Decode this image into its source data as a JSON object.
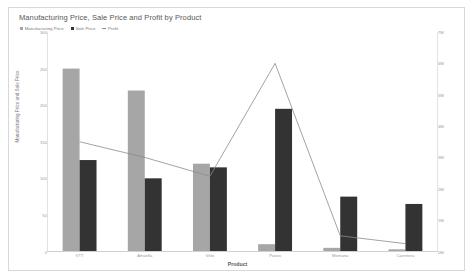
{
  "chart_data": {
    "type": "bar",
    "title": "Manufacturing Price, Sale Price and Profit by Product",
    "xlabel": "Product",
    "ylabel": "Manufacturing Price and Sale Price",
    "y2label": "Profit",
    "categories": [
      "VTT",
      "Amarilla",
      "Velo",
      "Paseo",
      "Montana",
      "Carretera"
    ],
    "series": [
      {
        "name": "Manufacturing Price",
        "type": "bar",
        "axis": "left",
        "color": "#a6a6a6",
        "values": [
          250,
          220,
          120,
          10,
          5,
          3
        ]
      },
      {
        "name": "Sale Price",
        "type": "bar",
        "axis": "left",
        "color": "#333333",
        "values": [
          125,
          100,
          115,
          195,
          75,
          65
        ]
      },
      {
        "name": "Profit",
        "type": "line",
        "axis": "right",
        "color": "#8c8c8c",
        "values": [
          3500000,
          3000000,
          2400000,
          6000000,
          500000,
          250000
        ]
      }
    ],
    "ylim": [
      0,
      300
    ],
    "yticks": [
      0,
      50,
      100,
      150,
      200,
      250,
      300
    ],
    "ytick_labels": [
      "0",
      "50",
      "100",
      "150",
      "200",
      "250",
      "300"
    ],
    "y2lim": [
      0,
      7000000
    ],
    "y2ticks": [
      0,
      1000000,
      2000000,
      3000000,
      4000000,
      5000000,
      6000000,
      7000000
    ],
    "y2tick_labels": [
      "0M",
      "1M",
      "2M",
      "3M",
      "4M",
      "5M",
      "6M",
      "7M"
    ],
    "grid": false,
    "legend_position": "top-left"
  },
  "legend": {
    "items": [
      {
        "label": "Manufacturing Price",
        "color": "#a6a6a6",
        "shape": "square"
      },
      {
        "label": "Sale Price",
        "color": "#333333",
        "shape": "square"
      },
      {
        "label": "Profit",
        "color": "#8c8c8c",
        "shape": "line"
      }
    ]
  }
}
